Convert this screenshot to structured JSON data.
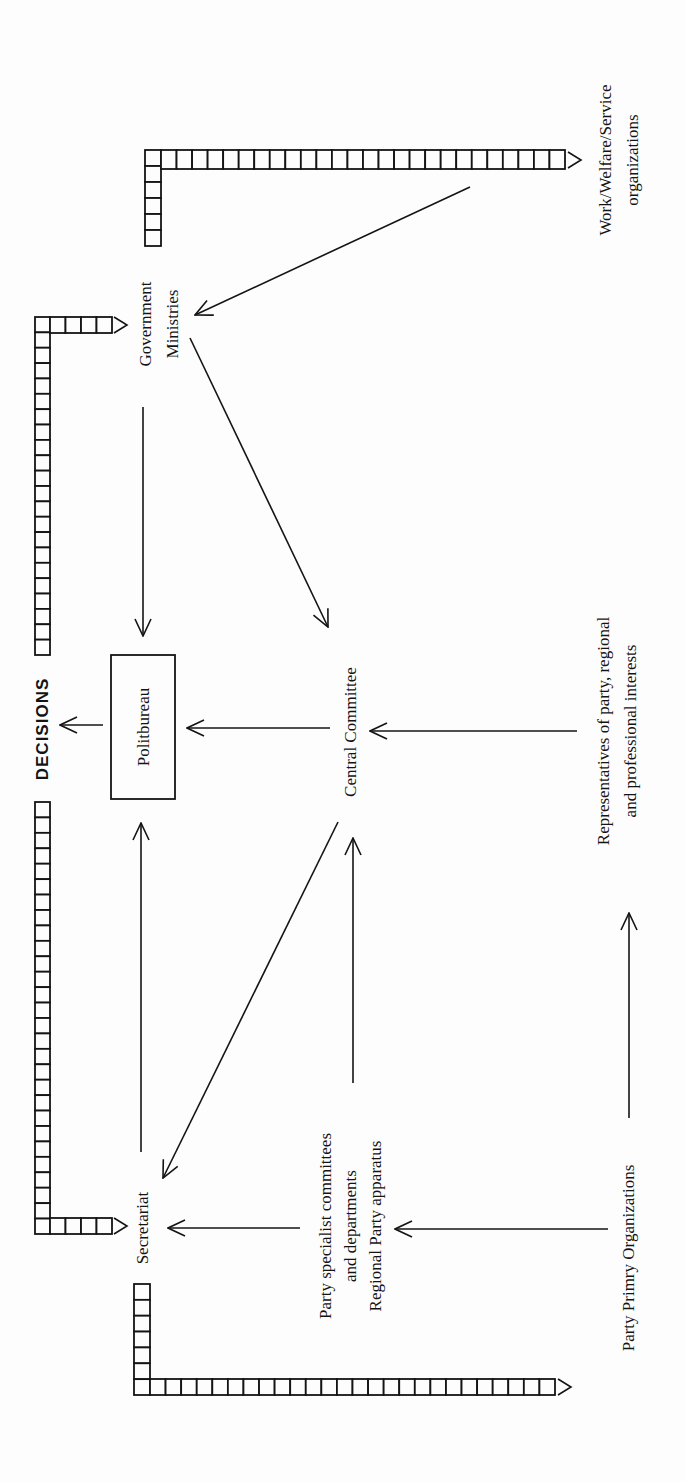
{
  "diagram": {
    "type": "flow-diagram",
    "orientation": "rotated 90 degrees counter-clockwise",
    "nodes": {
      "politbureau": {
        "label": "Politbureau",
        "boxed": true
      },
      "central_committee": {
        "label": "Central Committee"
      },
      "government_ministries": {
        "line1": "Government",
        "line2": "Ministries"
      },
      "secretariat": {
        "label": "Secretariat"
      },
      "work_welfare": {
        "line1": "Work/Welfare/Service",
        "line2": "organizations"
      },
      "representatives": {
        "line1": "Representatives of party, regional",
        "line2": "and professional interests"
      },
      "party_specialist": {
        "line1": "Party specialist committees",
        "line2": "and departments",
        "line3": "Regional Party apparatus"
      },
      "party_primary": {
        "label": "Party Primry Organizations"
      },
      "decisions": {
        "label": "DECISIONS"
      }
    },
    "edges": [
      {
        "from": "Government Ministries",
        "to": "Politbureau"
      },
      {
        "from": "Central Committee",
        "to": "Politbureau"
      },
      {
        "from": "Secretariat",
        "to": "Politbureau"
      },
      {
        "from": "Politbureau",
        "to": "DECISIONS"
      },
      {
        "from": "Work/Welfare/Service organizations",
        "to": "Government Ministries"
      },
      {
        "from": "Government Ministries",
        "to": "Central Committee"
      },
      {
        "from": "Representatives of party, regional and professional interests",
        "to": "Central Committee"
      },
      {
        "from": "Party specialist committees / Regional Party apparatus",
        "to": "Central Committee"
      },
      {
        "from": "Central Committee",
        "to": "Secretariat"
      },
      {
        "from": "Party specialist committees / Regional Party apparatus",
        "to": "Secretariat"
      },
      {
        "from": "Party Primry Organizations",
        "to": "Party specialist committees / Regional Party apparatus"
      },
      {
        "from": "Party Primry Organizations",
        "to": "Representatives of party, regional and professional interests"
      }
    ],
    "feedback_bars": [
      {
        "from": "DECISIONS",
        "to": "Government Ministries"
      },
      {
        "from": "DECISIONS",
        "to": "Secretariat"
      },
      {
        "to": "Work/Welfare/Service organizations"
      },
      {
        "to": "Party Primry Organizations"
      }
    ]
  }
}
